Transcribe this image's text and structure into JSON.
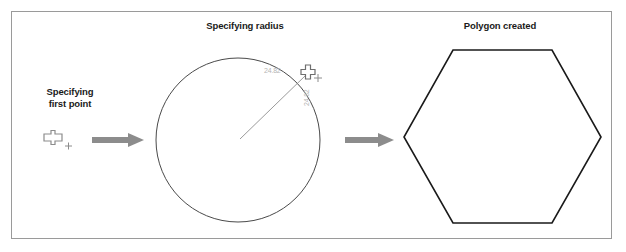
{
  "figure": {
    "title_absent": true,
    "border_color": "#9a9a9a",
    "background": "#ffffff"
  },
  "panels": [
    {
      "id": "panel-first-point",
      "caption": "Specifying\nfirst point",
      "cursor": {
        "type": "pickbox-crosshair-cursor",
        "color": "#8c8c8c",
        "x": 52,
        "y": 139
      }
    },
    {
      "id": "panel-specifying-radius",
      "caption": "Specifying radius",
      "circle": {
        "center_x": 238,
        "center_y": 140,
        "radius": 82,
        "stroke": "#4a4a4a"
      },
      "radius_line": {
        "from_x": 238,
        "from_y": 140,
        "to_x": 307,
        "to_y": 73,
        "stroke": "#8e8e8e"
      },
      "dimension_labels": [
        {
          "name": "horizontal-dimension",
          "value": "24.82",
          "color": "#b5b5b5",
          "x": 264,
          "y": 73,
          "rotation": 0
        },
        {
          "name": "vertical-dimension",
          "value": "24.82",
          "color": "#b5b5b5",
          "x": 309,
          "y": 104,
          "rotation": -90
        }
      ],
      "cursor": {
        "type": "pickbox-crosshair-cursor",
        "color": "#8c8c8c",
        "x": 308,
        "y": 73
      }
    },
    {
      "id": "panel-polygon-created",
      "caption": "Polygon created",
      "polygon": {
        "sides": 6,
        "center_x": 502,
        "center_y": 137,
        "radius": 100,
        "orientation": "flat-top",
        "stroke": "#1a1a1a"
      }
    }
  ],
  "arrows": [
    {
      "name": "arrow-first-point-to-radius",
      "x1": 92,
      "y1": 140,
      "x2": 140,
      "y2": 140,
      "color": "#8c8c8c"
    },
    {
      "name": "arrow-radius-to-polygon",
      "x1": 345,
      "y1": 140,
      "x2": 392,
      "y2": 140,
      "color": "#8c8c8c"
    }
  ]
}
